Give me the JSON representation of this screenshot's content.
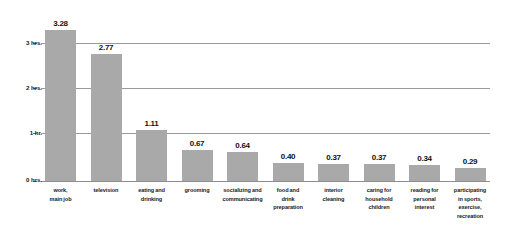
{
  "chart_data": {
    "type": "bar",
    "title": "",
    "subtitle": "",
    "xlabel": "",
    "ylabel": "",
    "ylim": [
      0,
      3.5
    ],
    "grid": true,
    "legend": null,
    "bar_color": "#a9a9a9",
    "categories": [
      "work, main job",
      "television",
      "eating and drinking",
      "grooming",
      "socializing and communicating",
      "food and drink preparation",
      "interior cleaning",
      "caring for household children",
      "reading for personal interest",
      "participating in sports, exercise, recreation"
    ],
    "category_lines": [
      [
        "work,",
        "main job"
      ],
      [
        "television"
      ],
      [
        "eating and",
        "drinking"
      ],
      [
        "grooming"
      ],
      [
        "socializing and",
        "communicating"
      ],
      [
        "food and",
        "drink",
        "preparation"
      ],
      [
        "interior",
        "cleaning"
      ],
      [
        "caring for",
        "household",
        "children"
      ],
      [
        "reading for",
        "personal",
        "interest"
      ],
      [
        "participating",
        "in sports,",
        "exercise,",
        "recreation"
      ]
    ],
    "values": [
      3.28,
      2.77,
      1.11,
      0.67,
      0.64,
      0.4,
      0.37,
      0.37,
      0.34,
      0.29
    ],
    "value_labels": [
      "3.28",
      "2.77",
      "1.11",
      "0.67",
      "0.64",
      "0.40",
      "0.37",
      "0.37",
      "0.34",
      "0.29"
    ],
    "yticks": [
      0,
      1,
      2,
      3
    ],
    "ytick_labels": [
      "0 hrs.",
      "1 hr.",
      "2 hrs.",
      "3 hrs."
    ]
  }
}
